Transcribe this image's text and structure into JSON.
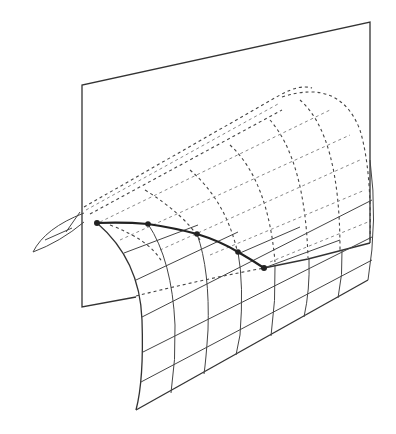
{
  "figure": {
    "elements": {
      "plane": "cutting-plane",
      "surface": "curved-surface-grid",
      "curve": "intersection-curve",
      "points_count": 5
    },
    "colors": {
      "line": "#333333",
      "hidden_line": "#888888",
      "background": "#ffffff"
    }
  }
}
